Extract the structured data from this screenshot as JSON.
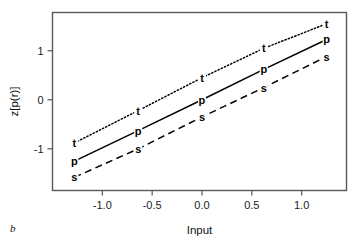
{
  "figure": {
    "panel_label": "b",
    "background": "#ffffff",
    "frame_color": "#555a5e"
  },
  "chart_data": {
    "type": "line",
    "title": "",
    "subtitle": "",
    "xlabel": "Input",
    "ylabel": "z[p(r)]",
    "xlim": [
      -1.5,
      1.45
    ],
    "ylim": [
      -1.85,
      1.78
    ],
    "xticks": [
      -1.0,
      -0.5,
      0.0,
      0.5,
      1.0
    ],
    "xtick_labels": [
      "-1.0",
      "-0.5",
      "0.0",
      "0.5",
      "1.0"
    ],
    "yticks": [
      -1,
      0,
      1
    ],
    "ytick_labels": [
      "-1",
      "0",
      "1"
    ],
    "grid": false,
    "legend": "none",
    "x": [
      -1.28,
      -0.64,
      0.0,
      0.62,
      1.25
    ],
    "series": [
      {
        "name": "t",
        "marker": "t",
        "linestyle": "dotted",
        "color": "#000000",
        "values": [
          -0.88,
          -0.22,
          0.45,
          1.05,
          1.55
        ]
      },
      {
        "name": "p",
        "marker": "p",
        "linestyle": "solid",
        "color": "#000000",
        "values": [
          -1.25,
          -0.63,
          0.0,
          0.62,
          1.23
        ]
      },
      {
        "name": "s",
        "marker": "s",
        "linestyle": "dashed",
        "color": "#000000",
        "values": [
          -1.58,
          -1.0,
          -0.35,
          0.25,
          0.88
        ]
      }
    ]
  }
}
